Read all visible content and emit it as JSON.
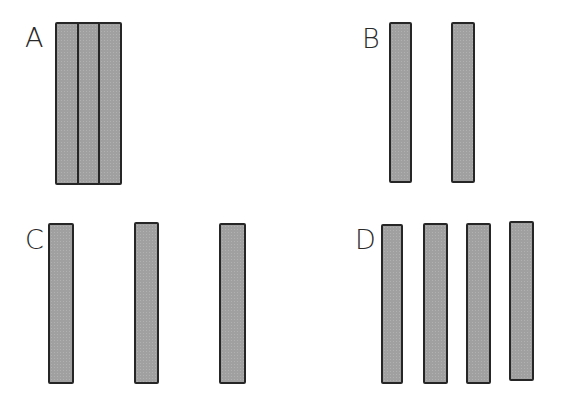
{
  "diagram": {
    "colors": {
      "bar_fill": "#a0a0a0",
      "bar_stroke": "#262626",
      "background": "#ffffff",
      "label": "#2a2a2a"
    },
    "panels": [
      {
        "label": "A",
        "label_pos": {
          "x": 25,
          "y": 26
        },
        "arrangement": "adjacent",
        "bars": [
          {
            "x": 55,
            "y": 22,
            "w": 25,
            "h": 162
          },
          {
            "x": 77,
            "y": 22,
            "w": 24,
            "h": 162
          },
          {
            "x": 98,
            "y": 22,
            "w": 23,
            "h": 162
          }
        ]
      },
      {
        "label": "B",
        "label_pos": {
          "x": 362,
          "y": 27
        },
        "arrangement": "spaced",
        "bars": [
          {
            "x": 389,
            "y": 22,
            "w": 23,
            "h": 161
          },
          {
            "x": 451,
            "y": 22,
            "w": 24,
            "h": 161
          }
        ]
      },
      {
        "label": "C",
        "label_pos": {
          "x": 25,
          "y": 227
        },
        "arrangement": "widely-spaced",
        "bars": [
          {
            "x": 48,
            "y": 223,
            "w": 26,
            "h": 161
          },
          {
            "x": 134,
            "y": 222,
            "w": 25,
            "h": 162
          },
          {
            "x": 219,
            "y": 223,
            "w": 27,
            "h": 161
          }
        ]
      },
      {
        "label": "D",
        "label_pos": {
          "x": 355,
          "y": 227
        },
        "arrangement": "evenly-spaced",
        "bars": [
          {
            "x": 381,
            "y": 224,
            "w": 22,
            "h": 160
          },
          {
            "x": 423,
            "y": 223,
            "w": 25,
            "h": 161
          },
          {
            "x": 466,
            "y": 223,
            "w": 25,
            "h": 161
          },
          {
            "x": 509,
            "y": 221,
            "w": 25,
            "h": 160
          }
        ]
      }
    ]
  }
}
